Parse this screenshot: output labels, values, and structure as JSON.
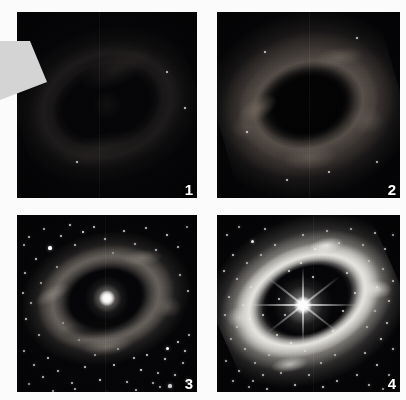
{
  "figure": {
    "kind": "astronomical-image-grid",
    "background_color": "#fbfbfb",
    "panel_background_color": "#050507",
    "rows": 2,
    "columns": 2,
    "panel_count": 4
  },
  "panels": [
    {
      "id": "panel-1",
      "number": "1",
      "caption": "",
      "brightness_stage": "faintest",
      "has_visible_core": false,
      "has_starfield": false,
      "ring_visibility": "barely visible"
    },
    {
      "id": "panel-2",
      "number": "2",
      "caption": "",
      "brightness_stage": "faint",
      "has_visible_core": false,
      "has_starfield": false,
      "ring_visibility": "clumpy ring, dark hollow centre"
    },
    {
      "id": "panel-3",
      "number": "3",
      "caption": "",
      "brightness_stage": "bright",
      "has_visible_core": true,
      "has_starfield": true,
      "ring_visibility": "broken dusty ring around glowing core"
    },
    {
      "id": "panel-4",
      "number": "4",
      "caption": "",
      "brightness_stage": "brightest",
      "has_visible_core": true,
      "has_starfield": true,
      "ring_visibility": "brilliant elliptical ring, star with diffraction spikes"
    }
  ],
  "pointer": {
    "name": "gray-arrow-pointer",
    "fill_color": "#d4d4d4",
    "visible": true
  },
  "starfields": {
    "panel3": [
      [
        12,
        22,
        1.4
      ],
      [
        27,
        14,
        1.0
      ],
      [
        33,
        33,
        1.6
      ],
      [
        19,
        44,
        1.1
      ],
      [
        44,
        21,
        0.9
      ],
      [
        53,
        10,
        1.2
      ],
      [
        8,
        58,
        1.0
      ],
      [
        24,
        68,
        0.9
      ],
      [
        40,
        52,
        0.8
      ],
      [
        58,
        30,
        1.0
      ],
      [
        66,
        17,
        1.3
      ],
      [
        77,
        12,
        1.0
      ],
      [
        88,
        24,
        1.1
      ],
      [
        96,
        38,
        1.0
      ],
      [
        107,
        16,
        0.9
      ],
      [
        118,
        29,
        1.2
      ],
      [
        129,
        13,
        1.0
      ],
      [
        139,
        35,
        1.1
      ],
      [
        150,
        20,
        1.4
      ],
      [
        161,
        32,
        1.0
      ],
      [
        170,
        12,
        0.9
      ],
      [
        14,
        88,
        1.0
      ],
      [
        9,
        104,
        1.2
      ],
      [
        22,
        120,
        0.9
      ],
      [
        7,
        136,
        1.0
      ],
      [
        17,
        150,
        1.1
      ],
      [
        31,
        143,
        0.9
      ],
      [
        26,
        162,
        1.2
      ],
      [
        12,
        169,
        1.0
      ],
      [
        41,
        156,
        0.9
      ],
      [
        55,
        168,
        1.0
      ],
      [
        68,
        152,
        0.9
      ],
      [
        83,
        165,
        1.1
      ],
      [
        97,
        150,
        0.8
      ],
      [
        110,
        167,
        1.0
      ],
      [
        124,
        155,
        1.2
      ],
      [
        136,
        168,
        1.0
      ],
      [
        148,
        144,
        1.1
      ],
      [
        158,
        160,
        1.4
      ],
      [
        166,
        148,
        1.2
      ],
      [
        171,
        166,
        1.6
      ],
      [
        150,
        133,
        1.5
      ],
      [
        161,
        127,
        1.2
      ],
      [
        141,
        158,
        1.0
      ],
      [
        168,
        136,
        1.3
      ],
      [
        153,
        171,
        1.6
      ],
      [
        172,
        120,
        1.0
      ],
      [
        143,
        172,
        1.1
      ],
      [
        130,
        140,
        0.8
      ],
      [
        117,
        143,
        0.9
      ],
      [
        101,
        134,
        0.8
      ],
      [
        6,
        78,
        0.9
      ],
      [
        163,
        60,
        1.0
      ],
      [
        171,
        76,
        0.9
      ],
      [
        7,
        30,
        1.1
      ],
      [
        58,
        174,
        0.9
      ],
      [
        36,
        176,
        1.0
      ],
      [
        90,
        178,
        0.9
      ],
      [
        119,
        175,
        1.0
      ],
      [
        46,
        108,
        0.7
      ],
      [
        62,
        125,
        0.7
      ],
      [
        78,
        140,
        0.7
      ]
    ],
    "panel4": [
      [
        10,
        20,
        1.4
      ],
      [
        22,
        12,
        1.1
      ],
      [
        35,
        26,
        1.5
      ],
      [
        48,
        14,
        1.0
      ],
      [
        58,
        30,
        1.2
      ],
      [
        16,
        40,
        1.3
      ],
      [
        30,
        48,
        1.0
      ],
      [
        44,
        40,
        0.9
      ],
      [
        7,
        56,
        1.2
      ],
      [
        20,
        64,
        1.0
      ],
      [
        34,
        72,
        1.1
      ],
      [
        12,
        82,
        1.3
      ],
      [
        26,
        90,
        1.0
      ],
      [
        8,
        100,
        1.2
      ],
      [
        20,
        112,
        1.0
      ],
      [
        33,
        104,
        0.9
      ],
      [
        14,
        124,
        1.1
      ],
      [
        28,
        134,
        1.3
      ],
      [
        9,
        146,
        1.0
      ],
      [
        22,
        156,
        1.2
      ],
      [
        38,
        148,
        0.9
      ],
      [
        16,
        166,
        1.3
      ],
      [
        32,
        172,
        1.0
      ],
      [
        46,
        160,
        1.1
      ],
      [
        52,
        140,
        0.9
      ],
      [
        60,
        120,
        0.8
      ],
      [
        68,
        100,
        0.8
      ],
      [
        72,
        56,
        1.0
      ],
      [
        86,
        20,
        1.1
      ],
      [
        98,
        34,
        1.2
      ],
      [
        110,
        16,
        1.0
      ],
      [
        122,
        28,
        1.3
      ],
      [
        134,
        14,
        1.0
      ],
      [
        146,
        30,
        1.2
      ],
      [
        158,
        18,
        1.4
      ],
      [
        168,
        34,
        1.1
      ],
      [
        176,
        20,
        1.0
      ],
      [
        152,
        46,
        1.0
      ],
      [
        166,
        54,
        1.2
      ],
      [
        176,
        66,
        1.3
      ],
      [
        160,
        72,
        1.0
      ],
      [
        172,
        86,
        1.4
      ],
      [
        158,
        96,
        1.1
      ],
      [
        170,
        108,
        1.2
      ],
      [
        150,
        112,
        0.9
      ],
      [
        164,
        124,
        1.3
      ],
      [
        176,
        134,
        1.1
      ],
      [
        148,
        138,
        1.0
      ],
      [
        160,
        150,
        1.4
      ],
      [
        172,
        160,
        1.2
      ],
      [
        140,
        160,
        1.0
      ],
      [
        152,
        170,
        1.3
      ],
      [
        166,
        174,
        1.1
      ],
      [
        120,
        166,
        1.0
      ],
      [
        106,
        172,
        1.2
      ],
      [
        92,
        160,
        0.9
      ],
      [
        78,
        170,
        1.1
      ],
      [
        64,
        158,
        1.0
      ],
      [
        50,
        174,
        1.2
      ],
      [
        36,
        166,
        0.9
      ],
      [
        104,
        148,
        0.8
      ],
      [
        118,
        140,
        0.8
      ],
      [
        88,
        136,
        0.7
      ],
      [
        74,
        128,
        0.7
      ],
      [
        96,
        62,
        0.8
      ],
      [
        84,
        48,
        0.9
      ],
      [
        130,
        58,
        0.9
      ],
      [
        138,
        78,
        0.8
      ],
      [
        126,
        96,
        0.8
      ],
      [
        116,
        116,
        0.8
      ],
      [
        62,
        84,
        0.7
      ],
      [
        46,
        100,
        0.7
      ]
    ],
    "panel2": [
      [
        140,
        26,
        0.8
      ],
      [
        48,
        40,
        0.7
      ],
      [
        160,
        150,
        0.8
      ],
      [
        70,
        168,
        0.7
      ],
      [
        112,
        160,
        0.7
      ],
      [
        30,
        120,
        0.6
      ]
    ],
    "panel1": [
      [
        168,
        96,
        0.8
      ],
      [
        150,
        60,
        0.6
      ],
      [
        60,
        150,
        0.6
      ]
    ]
  }
}
